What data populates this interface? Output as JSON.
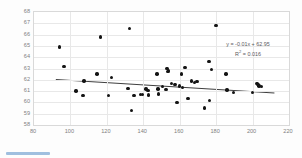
{
  "chart_data": {
    "type": "scatter",
    "title": "",
    "xlabel": "",
    "ylabel": "",
    "xlim": [
      80,
      220
    ],
    "ylim": [
      58,
      68
    ],
    "xticks": [
      80,
      100,
      120,
      140,
      160,
      180,
      200,
      220
    ],
    "yticks": [
      58,
      59,
      60,
      61,
      62,
      63,
      64,
      65,
      66,
      67,
      68
    ],
    "grid": true,
    "legend": "none",
    "marker_color": "#141414",
    "grid_color": "#e8e8e8",
    "axis_text_color": "#7f7f7f",
    "annotation_color": "#59595c",
    "trendline": {
      "color": "#3f3f3f",
      "equation": "y = -0.01x + 62.95",
      "r_squared_label": "R",
      "r_squared_sup": "2",
      "r_squared_value": " = 0.016",
      "slope": -0.01,
      "intercept": 62.95,
      "r2": 0.016,
      "x_start": 92,
      "x_end": 212
    },
    "points": [
      [
        94.0,
        64.9
      ],
      [
        96.5,
        63.2
      ],
      [
        103.0,
        61.0
      ],
      [
        107.0,
        60.6
      ],
      [
        107.5,
        61.9
      ],
      [
        114.5,
        62.5
      ],
      [
        116.5,
        65.8
      ],
      [
        121.0,
        60.6
      ],
      [
        122.5,
        62.2
      ],
      [
        131.5,
        61.25
      ],
      [
        132.5,
        66.55
      ],
      [
        133.5,
        59.3
      ],
      [
        135.0,
        60.6
      ],
      [
        138.5,
        60.7
      ],
      [
        139.5,
        60.7
      ],
      [
        141.5,
        61.2
      ],
      [
        142.5,
        61.05
      ],
      [
        143.0,
        60.65
      ],
      [
        147.5,
        62.5
      ],
      [
        148.0,
        61.2
      ],
      [
        148.5,
        60.75
      ],
      [
        150.5,
        61.4
      ],
      [
        152.5,
        61.15
      ],
      [
        153.0,
        63.0
      ],
      [
        153.5,
        62.75
      ],
      [
        154.0,
        62.85
      ],
      [
        155.5,
        61.65
      ],
      [
        157.5,
        61.6
      ],
      [
        158.5,
        60.0
      ],
      [
        160.0,
        61.45
      ],
      [
        161.0,
        62.5
      ],
      [
        161.5,
        61.3
      ],
      [
        163.0,
        63.1
      ],
      [
        164.5,
        60.35
      ],
      [
        166.5,
        61.9
      ],
      [
        168.0,
        61.75
      ],
      [
        169.5,
        61.85
      ],
      [
        173.5,
        59.5
      ],
      [
        176.0,
        63.6
      ],
      [
        176.5,
        60.15
      ],
      [
        177.5,
        62.9
      ],
      [
        180.0,
        66.8
      ],
      [
        185.5,
        62.5
      ],
      [
        186.0,
        61.1
      ],
      [
        189.5,
        60.9
      ],
      [
        200.0,
        60.85
      ],
      [
        202.5,
        61.7
      ],
      [
        203.0,
        61.6
      ],
      [
        203.5,
        61.45
      ],
      [
        205.0,
        61.4
      ]
    ]
  }
}
